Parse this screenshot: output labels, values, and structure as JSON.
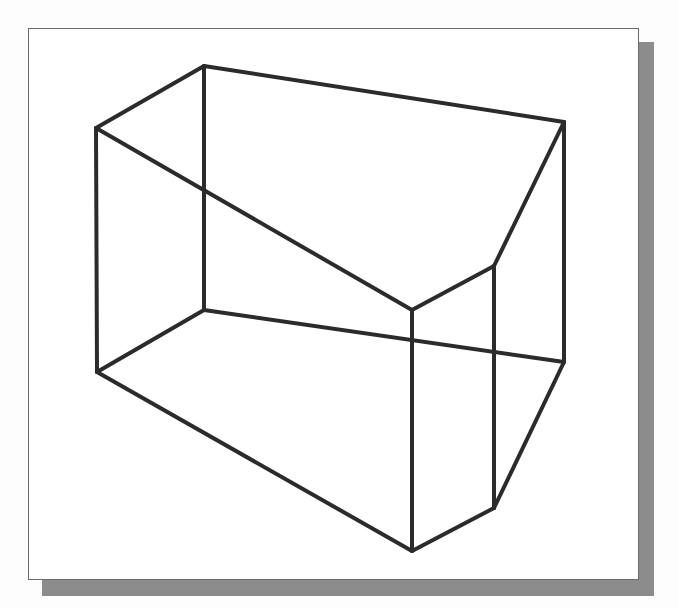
{
  "figure": {
    "colors": {
      "background": "#ffffff",
      "frame_border": "#6a6a6a",
      "shadow": "#8c8c8c",
      "edge": "#2b2b2b"
    },
    "vertices": {
      "top_back_left": [
        204,
        66
      ],
      "top_front_left": [
        96,
        128
      ],
      "top_back_right": [
        564,
        122
      ],
      "top_chamfer_front": [
        412,
        310
      ],
      "top_chamfer_right": [
        494,
        266
      ],
      "bottom_back_left": [
        204,
        310
      ],
      "bottom_front_left": [
        97,
        372
      ],
      "bottom_back_right": [
        564,
        362
      ],
      "bottom_chamfer_front": [
        412,
        551
      ],
      "bottom_chamfer_right": [
        494,
        508
      ]
    },
    "edges": [
      {
        "name": "top-back-edge",
        "from": "top_back_left",
        "to": "top_back_right"
      },
      {
        "name": "top-left-edge",
        "from": "top_back_left",
        "to": "top_front_left"
      },
      {
        "name": "top-front-edge",
        "from": "top_front_left",
        "to": "top_chamfer_front"
      },
      {
        "name": "top-chamfer-edge",
        "from": "top_chamfer_front",
        "to": "top_chamfer_right"
      },
      {
        "name": "top-right-edge",
        "from": "top_chamfer_right",
        "to": "top_back_right"
      },
      {
        "name": "bottom-left-edge",
        "from": "bottom_back_left",
        "to": "bottom_front_left"
      },
      {
        "name": "bottom-front-edge",
        "from": "bottom_front_left",
        "to": "bottom_chamfer_front"
      },
      {
        "name": "bottom-chamfer-edge",
        "from": "bottom_chamfer_front",
        "to": "bottom_chamfer_right"
      },
      {
        "name": "bottom-right-edge",
        "from": "bottom_chamfer_right",
        "to": "bottom_back_right"
      },
      {
        "name": "bottom-back-edge",
        "from": "bottom_back_left",
        "to": "bottom_back_right"
      },
      {
        "name": "vertical-back-left-edge",
        "from": "top_back_left",
        "to": "bottom_back_left"
      },
      {
        "name": "vertical-front-left-edge",
        "from": "top_front_left",
        "to": "bottom_front_left"
      },
      {
        "name": "vertical-chamfer-front-edge",
        "from": "top_chamfer_front",
        "to": "bottom_chamfer_front"
      },
      {
        "name": "vertical-chamfer-right-edge",
        "from": "top_chamfer_right",
        "to": "bottom_chamfer_right"
      },
      {
        "name": "vertical-back-right-edge",
        "from": "top_back_right",
        "to": "bottom_back_right"
      }
    ]
  }
}
